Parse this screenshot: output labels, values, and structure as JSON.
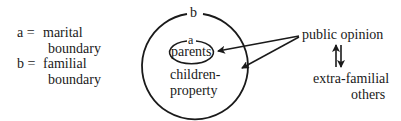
{
  "legend": {
    "a_key": "a =",
    "a_line1": "marital",
    "a_line2": "boundary",
    "b_key": "b =",
    "b_line1": "familial",
    "b_line2": "boundary"
  },
  "diagram": {
    "outer_label": "b",
    "inner_label": "a",
    "inner_text": "parents",
    "outer_text_line1": "children-",
    "outer_text_line2": "property",
    "source_label": "public opinion",
    "other_label_line1": "extra-familial",
    "other_label_line2": "others",
    "line_color": "#1a1a1a"
  }
}
